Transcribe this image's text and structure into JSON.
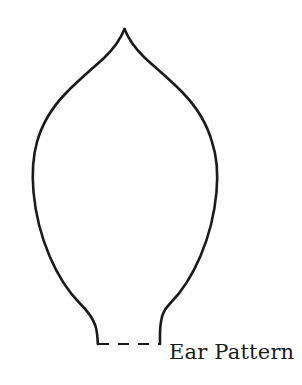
{
  "document": {
    "type": "craft-pattern-template",
    "background_color": "#ffffff",
    "width": 302,
    "height": 385
  },
  "pattern": {
    "name": "ear-pattern-outline",
    "shape_description": "leaf / teardrop outline with pointed top apex and two short stems at the bottom",
    "stroke_color": "#1a1a1a",
    "fill_color": "none",
    "stroke_width": 2.6,
    "apex": {
      "x": 124,
      "y": 29
    },
    "widest_left": {
      "x": 33,
      "y": 182
    },
    "widest_right": {
      "x": 219,
      "y": 182
    },
    "stem_left_end": {
      "x": 98,
      "y": 344
    },
    "stem_right_end": {
      "x": 160,
      "y": 344
    },
    "outline_path": "M124,29 C116,46 104,58 86,72 C62,91 44,117 36,148 C30,172 32,200 40,226 C50,258 68,286 85,305 C94,316 98,326 98,344 M124,29 C132,46 144,58 162,72 C186,91 204,117 212,148 C218,172 216,200 208,226 C198,258 180,286 163,305 C154,316 160,326 160,344"
  },
  "dashed_baseline": {
    "name": "fold-line",
    "from": {
      "x": 98,
      "y": 344
    },
    "to": {
      "x": 160,
      "y": 344
    },
    "stroke_color": "#1a1a1a",
    "stroke_width": 2.2,
    "dash_pattern": "11 9"
  },
  "caption": {
    "text": "Ear Pattern",
    "color": "#1b1b1b",
    "x": 169,
    "y": 340,
    "font_size_px": 21
  }
}
